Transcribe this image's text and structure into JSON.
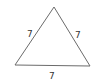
{
  "diagram": {
    "type": "equilateral-triangle",
    "stroke_color": "#6b6b6b",
    "vertices": {
      "apex": [
        54,
        7
      ],
      "bottom_left": [
        15,
        65
      ],
      "bottom_right": [
        90,
        66
      ]
    },
    "side_labels": {
      "left": "7",
      "right": "7",
      "bottom": "7"
    }
  }
}
